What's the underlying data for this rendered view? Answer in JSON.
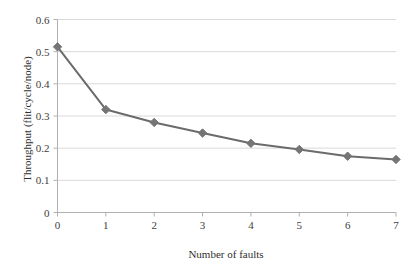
{
  "chart_data": {
    "type": "line",
    "title": "",
    "xlabel": "Number of faults",
    "ylabel": "Throughput (flit/cycle/node)",
    "x": [
      0,
      1,
      2,
      3,
      4,
      5,
      6,
      7
    ],
    "values": [
      0.515,
      0.32,
      0.28,
      0.247,
      0.215,
      0.196,
      0.175,
      0.165
    ],
    "series": [
      {
        "name": "Throughput",
        "values": [
          0.515,
          0.32,
          0.28,
          0.247,
          0.215,
          0.196,
          0.175,
          0.165
        ]
      }
    ],
    "xlim": [
      0,
      7
    ],
    "ylim": [
      0,
      0.6
    ],
    "xticks": [
      "0",
      "1",
      "2",
      "3",
      "4",
      "5",
      "6",
      "7"
    ],
    "yticks": [
      "0",
      "0.1",
      "0.2",
      "0.3",
      "0.4",
      "0.5",
      "0.6"
    ],
    "ytick_values": [
      0,
      0.1,
      0.2,
      0.3,
      0.4,
      0.5,
      0.6
    ],
    "grid": "horizontal",
    "legend": "none",
    "marker": "diamond",
    "colors": {
      "line": "#6b6b6b",
      "marker": "#757575",
      "gridline": "#d9d9d9",
      "axis": "#b0b0b0",
      "text": "#3d3d3d",
      "background": "#ffffff"
    }
  },
  "axes": {
    "x_title": "Number of faults",
    "y_title": "Throughput (flit/cycle/node)"
  }
}
